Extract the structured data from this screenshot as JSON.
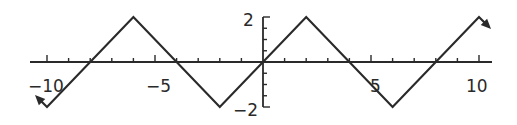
{
  "chart_data": {
    "type": "line",
    "title": "",
    "xlabel": "",
    "ylabel": "",
    "xlim": [
      -10,
      10
    ],
    "ylim": [
      -2,
      2
    ],
    "grid": false,
    "x_tick_labels": [
      "-10",
      "-5",
      "5",
      "10"
    ],
    "y_tick_labels": [
      "2",
      "-2"
    ],
    "x_ticks": [
      -10,
      -9,
      -8,
      -7,
      -6,
      -5,
      -4,
      -3,
      -2,
      -1,
      1,
      2,
      3,
      4,
      5,
      6,
      7,
      8,
      9,
      10
    ],
    "y_ticks": [
      -2,
      -1.5,
      -1,
      -0.5,
      0.5,
      1,
      1.5,
      2
    ],
    "series": [
      {
        "name": "triangle wave",
        "x": [
          -10,
          -6,
          -2,
          2,
          6,
          10
        ],
        "y": [
          -2,
          2,
          -2,
          2,
          -2,
          2
        ],
        "arrows_at_ends": true
      }
    ]
  },
  "labels": {
    "x_neg10": "−10",
    "x_neg5": "−5",
    "x_5": "5",
    "x_10": "10",
    "y_2": "2",
    "y_neg2": "−2"
  }
}
